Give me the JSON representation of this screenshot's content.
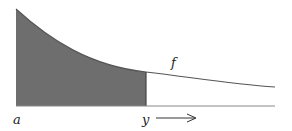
{
  "diagram": {
    "labels": {
      "a": "a",
      "y": "y",
      "f": "f"
    },
    "colors": {
      "shade": "#6e6e6e",
      "line": "#555555",
      "baseline": "#888888"
    }
  }
}
